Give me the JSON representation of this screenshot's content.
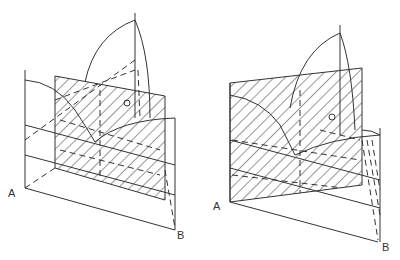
{
  "figure": {
    "panels": [
      {
        "id": "left",
        "labels": {
          "a": "A",
          "b": "B",
          "c": "C"
        },
        "hatch_color": "#333333"
      },
      {
        "id": "right",
        "labels": {
          "a": "A",
          "b": "B",
          "c": "C"
        },
        "hatch_color": "#333333"
      }
    ]
  },
  "colors": {
    "background": "#ffffff",
    "stroke": "#333333"
  }
}
